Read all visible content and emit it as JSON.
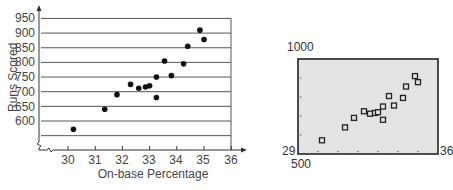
{
  "chart_data": [
    {
      "type": "scatter",
      "title": "",
      "xlabel": "On-base Percentage",
      "ylabel": "Runs Scored",
      "x_ticks": [
        "30",
        "31",
        "32",
        "33",
        "34",
        "35",
        "36"
      ],
      "y_ticks": [
        "600",
        "650",
        "700",
        "750",
        "800",
        "850",
        "900",
        "950"
      ],
      "xlim": [
        29,
        36
      ],
      "ylim": [
        525,
        975
      ],
      "grid": "horizontal",
      "axis_break": true,
      "series": [
        {
          "name": "Teams",
          "x": [
            30.2,
            31.35,
            31.8,
            32.3,
            32.6,
            32.85,
            33.0,
            33.25,
            33.25,
            33.55,
            33.8,
            34.25,
            34.4,
            34.85,
            35.0
          ],
          "y": [
            572,
            640,
            690,
            725,
            712,
            716,
            720,
            750,
            680,
            805,
            755,
            795,
            855,
            910,
            878
          ]
        }
      ]
    },
    {
      "type": "scatter",
      "title": "Graphing calculator screen",
      "window": {
        "xmin": 29,
        "xmax": 36,
        "ymin": 500,
        "ymax": 1000
      },
      "labels": {
        "top_left": "1000",
        "bottom_left_y": "29",
        "bottom_left_x": "500",
        "bottom_right": "36"
      },
      "series": [
        {
          "name": "Teams",
          "x": [
            30.2,
            31.35,
            31.8,
            32.3,
            32.6,
            32.85,
            33.0,
            33.25,
            33.25,
            33.55,
            33.8,
            34.25,
            34.4,
            34.85,
            35.0
          ],
          "y": [
            572,
            640,
            690,
            725,
            712,
            716,
            720,
            750,
            680,
            805,
            755,
            795,
            855,
            910,
            878
          ]
        }
      ]
    }
  ],
  "main_chart": {
    "xlabel": "On-base Percentage",
    "ylabel": "Runs Scored",
    "x_ticks": [
      "30",
      "31",
      "32",
      "33",
      "34",
      "35",
      "36"
    ],
    "y_ticks": [
      "950",
      "900",
      "850",
      "800",
      "750",
      "700",
      "650",
      "600"
    ]
  },
  "calc": {
    "ymax_label": "1000",
    "xmin_label": "29",
    "ymin_label": "500",
    "xmax_label": "36"
  }
}
